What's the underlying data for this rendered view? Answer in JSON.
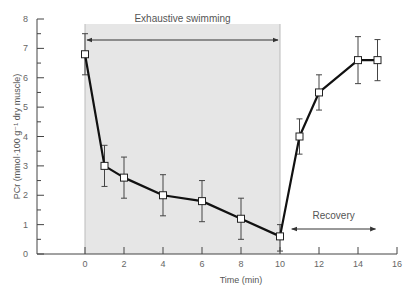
{
  "chart_data": {
    "type": "line",
    "title": "",
    "xlabel": "Time (min)",
    "ylabel": "PCr (mmol·100 g⁻¹ dry muscle)",
    "xlim": [
      -4,
      16
    ],
    "ylim": [
      0,
      8
    ],
    "xticks": [
      0,
      2,
      4,
      6,
      8,
      10,
      12,
      14,
      16
    ],
    "yticks": [
      0,
      1,
      2,
      3,
      4,
      5,
      6,
      7,
      8
    ],
    "grid": false,
    "series": [
      {
        "name": "PCr",
        "x": [
          0,
          1,
          2,
          4,
          6,
          8,
          10,
          11,
          12,
          14,
          15
        ],
        "y": [
          6.8,
          3.0,
          2.6,
          2.0,
          1.8,
          1.2,
          0.6,
          4.0,
          5.5,
          6.6,
          6.6
        ],
        "err_low": [
          6.1,
          2.3,
          1.9,
          1.3,
          1.1,
          0.5,
          0.1,
          3.4,
          4.9,
          5.8,
          5.9
        ],
        "err_high": [
          7.5,
          3.7,
          3.3,
          2.7,
          2.5,
          1.9,
          1.0,
          4.6,
          6.1,
          7.4,
          7.3
        ],
        "marker": "open-square",
        "color": "#111111"
      }
    ],
    "shaded_region": {
      "x_from": 0,
      "x_to": 10,
      "color": "#e6e6e6"
    },
    "annotations": [
      {
        "text": "Exhaustive swimming",
        "x_from": 0,
        "x_to": 10,
        "y": 7.3,
        "arrow": "double"
      },
      {
        "text": "Recovery",
        "x_from": 10.5,
        "x_to": 15,
        "y": 0.6,
        "arrow": "double"
      }
    ]
  }
}
